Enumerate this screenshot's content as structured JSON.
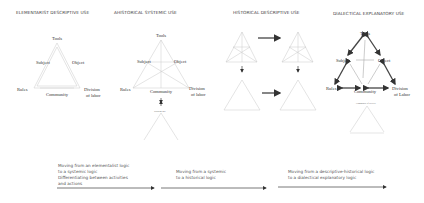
{
  "panels": [
    {
      "title": "ELEMENTARIST DESCRIPTIVE USE",
      "nodes": {
        "tools": "Tools",
        "subject": "Subject",
        "object": "Object",
        "rules": "Rules",
        "community": "Community",
        "division": "Division",
        "division2": "of labor"
      }
    },
    {
      "title": "AHISTORICAL SYSTEMIC USE",
      "nodes": {
        "tools": "Tools",
        "subject": "Subject",
        "object": "Object",
        "rules": "Rules",
        "community": "Community",
        "division": "Division",
        "division2": "of labor"
      }
    },
    {
      "title": "HISTORICAL DESCRIPTIVE USE"
    },
    {
      "title": "DIALECTICAL EXPLANATORY USE",
      "nodes": {
        "tools": "Tools",
        "subject": "Subject",
        "object": "Object",
        "rules": "Rules",
        "community": "Community",
        "division": "Division",
        "division2": "of Labor"
      }
    }
  ],
  "captions": [
    {
      "lines": [
        "Moving from an elementalist logic",
        "to a systemic logic",
        "Differentiating between activities",
        "and actions"
      ]
    },
    {
      "lines": [
        "Moving from a systemic",
        "to a historical logic"
      ]
    },
    {
      "lines": [
        "Moving from a descriptive-historical logic",
        "to a dialectical explanatory logic"
      ]
    }
  ],
  "colors": {
    "line": "#c8c8c8",
    "arrow": "#444444",
    "text": "#444444"
  }
}
